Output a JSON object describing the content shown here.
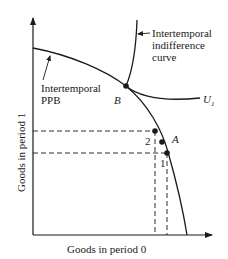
{
  "diagram": {
    "axes": {
      "x_label": "Goods in period 0",
      "y_label": "Goods in period 1"
    },
    "curves": {
      "ppb_label_line1": "Intertemporal",
      "ppb_label_line2": "PPB",
      "indiff_label_line1": "Intertemporal",
      "indiff_label_line2": "indifference",
      "indiff_label_line3": "curve",
      "u_label": "U",
      "u_subscript": "1"
    },
    "points": {
      "B": "B",
      "A": "A",
      "p1": "1",
      "p2": "2"
    },
    "colors": {
      "ink": "#1a1a1a",
      "background": "#ffffff"
    }
  }
}
